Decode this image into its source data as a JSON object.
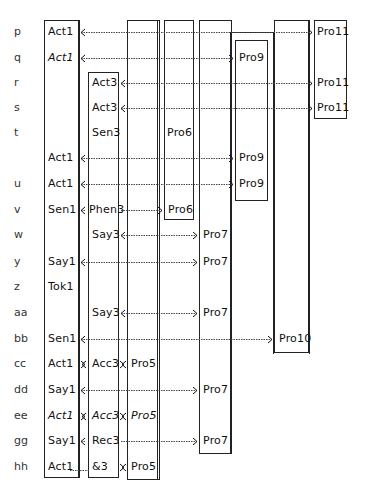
{
  "rows": [
    {
      "label": "p",
      "y": 32
    },
    {
      "label": "q",
      "y": 58
    },
    {
      "label": "r",
      "y": 83
    },
    {
      "label": "s",
      "y": 108
    },
    {
      "label": "t",
      "y": 133
    },
    {
      "label": "",
      "y": 158
    },
    {
      "label": "u",
      "y": 184
    },
    {
      "label": "v",
      "y": 210
    },
    {
      "label": "w",
      "y": 235
    },
    {
      "label": "y",
      "y": 262
    },
    {
      "label": "z",
      "y": 287
    },
    {
      "label": "aa",
      "y": 313
    },
    {
      "label": "bb",
      "y": 339
    },
    {
      "label": "cc",
      "y": 364
    },
    {
      "label": "dd",
      "y": 390
    },
    {
      "label": "ee",
      "y": 416
    },
    {
      "label": "gg",
      "y": 441
    },
    {
      "label": "hh",
      "y": 467
    }
  ],
  "cells": [
    {
      "text": "Act1",
      "x": 48,
      "y": 32,
      "italic": false
    },
    {
      "text": "Act1",
      "x": 48,
      "y": 58,
      "italic": true
    },
    {
      "text": "Act3",
      "x": 92,
      "y": 83,
      "italic": false
    },
    {
      "text": "Act3",
      "x": 92,
      "y": 108,
      "italic": false
    },
    {
      "text": "Sen3",
      "x": 92,
      "y": 133,
      "italic": false
    },
    {
      "text": "Pro6",
      "x": 167,
      "y": 133,
      "italic": false
    },
    {
      "text": "Act1",
      "x": 48,
      "y": 158,
      "italic": false
    },
    {
      "text": "Act1",
      "x": 48,
      "y": 184,
      "italic": false
    },
    {
      "text": "Sen1",
      "x": 48,
      "y": 210,
      "italic": false
    },
    {
      "text": "Phen3",
      "x": 89,
      "y": 210,
      "italic": false
    },
    {
      "text": "Pro6",
      "x": 168,
      "y": 210,
      "italic": false
    },
    {
      "text": "Say3",
      "x": 92,
      "y": 235,
      "italic": false
    },
    {
      "text": "Pro7",
      "x": 203,
      "y": 235,
      "italic": false
    },
    {
      "text": "Say1",
      "x": 48,
      "y": 262,
      "italic": false
    },
    {
      "text": "Pro7",
      "x": 203,
      "y": 262,
      "italic": false
    },
    {
      "text": "Tok1",
      "x": 48,
      "y": 287,
      "italic": false
    },
    {
      "text": "Say3",
      "x": 92,
      "y": 313,
      "italic": false
    },
    {
      "text": "Pro7",
      "x": 203,
      "y": 313,
      "italic": false
    },
    {
      "text": "Sen1",
      "x": 48,
      "y": 339,
      "italic": false
    },
    {
      "text": "Pro10",
      "x": 279,
      "y": 339,
      "italic": false
    },
    {
      "text": "Act1",
      "x": 48,
      "y": 364,
      "italic": false
    },
    {
      "text": "Acc3",
      "x": 92,
      "y": 364,
      "italic": false
    },
    {
      "text": "Pro5",
      "x": 131,
      "y": 364,
      "italic": false
    },
    {
      "text": "Say1",
      "x": 48,
      "y": 390,
      "italic": false
    },
    {
      "text": "Pro7",
      "x": 203,
      "y": 390,
      "italic": false
    },
    {
      "text": "Act1",
      "x": 48,
      "y": 416,
      "italic": true
    },
    {
      "text": "Acc3",
      "x": 92,
      "y": 416,
      "italic": true
    },
    {
      "text": "Pro5",
      "x": 131,
      "y": 416,
      "italic": true
    },
    {
      "text": "Say1",
      "x": 48,
      "y": 441,
      "italic": false
    },
    {
      "text": "Rec3",
      "x": 92,
      "y": 441,
      "italic": false
    },
    {
      "text": "Pro7",
      "x": 203,
      "y": 441,
      "italic": false
    },
    {
      "text": "Act1",
      "x": 48,
      "y": 467,
      "italic": false
    },
    {
      "text": "&3",
      "x": 92,
      "y": 467,
      "italic": false
    },
    {
      "text": "Pro5",
      "x": 131,
      "y": 467,
      "italic": false
    },
    {
      "text": "Pro9",
      "x": 239,
      "y": 58,
      "italic": false
    },
    {
      "text": "Pro9",
      "x": 239,
      "y": 158,
      "italic": false
    },
    {
      "text": "Pro9",
      "x": 239,
      "y": 184,
      "italic": false
    },
    {
      "text": "Pro11",
      "x": 317,
      "y": 32,
      "italic": false
    },
    {
      "text": "Pro11",
      "x": 317,
      "y": 83,
      "italic": false
    },
    {
      "text": "Pro11",
      "x": 317,
      "y": 108,
      "italic": false
    }
  ],
  "boxes": [
    {
      "name": "act1-column",
      "x": 44,
      "y": 20,
      "w": 35,
      "h": 458
    },
    {
      "name": "act3-column",
      "x": 88,
      "y": 72,
      "w": 31,
      "h": 406
    },
    {
      "name": "pro5-column",
      "x": 127,
      "y": 20,
      "w": 33,
      "h": 460
    },
    {
      "name": "pro6-box",
      "x": 164,
      "y": 20,
      "w": 30,
      "h": 200
    },
    {
      "name": "pro7-column",
      "x": 199,
      "y": 20,
      "w": 33,
      "h": 434
    },
    {
      "name": "pro9-box",
      "x": 235,
      "y": 40,
      "w": 33,
      "h": 161
    },
    {
      "name": "pro10-box",
      "x": 274,
      "y": 20,
      "w": 35,
      "h": 333
    },
    {
      "name": "pro11-box",
      "x": 314,
      "y": 20,
      "w": 33,
      "h": 99
    }
  ],
  "extra_vlines": [
    {
      "x": 157,
      "y1": 20,
      "y2": 480
    },
    {
      "x": 79,
      "y1": 20,
      "y2": 478
    },
    {
      "x": 230,
      "y1": 32,
      "y2": 454
    },
    {
      "x": 273,
      "y1": 32,
      "y2": 354
    },
    {
      "x": 309,
      "y1": 20,
      "y2": 354
    }
  ],
  "extra_hlines": [
    {
      "x1": 230,
      "x2": 273,
      "y": 32
    }
  ],
  "arrows": [
    {
      "row": "p",
      "x1": 79,
      "x2": 314,
      "y": 32,
      "head1": "left",
      "head2": "right"
    },
    {
      "row": "q",
      "x1": 79,
      "x2": 235,
      "y": 58,
      "head1": "left",
      "head2": "right"
    },
    {
      "row": "r",
      "x1": 119,
      "x2": 314,
      "y": 83,
      "head1": "left",
      "head2": "right"
    },
    {
      "row": "s",
      "x1": 119,
      "x2": 314,
      "y": 108,
      "head1": "left",
      "head2": "right"
    },
    {
      "row": "act1-pro9-a",
      "x1": 79,
      "x2": 235,
      "y": 158,
      "head1": "left",
      "head2": "right"
    },
    {
      "row": "u",
      "x1": 79,
      "x2": 235,
      "y": 184,
      "head1": "left",
      "head2": "right"
    },
    {
      "row": "v-left",
      "x1": 79,
      "x2": 88,
      "y": 210,
      "head1": "left",
      "head2": "none"
    },
    {
      "row": "v-right",
      "x1": 119,
      "x2": 164,
      "y": 210,
      "head1": "none",
      "head2": "right"
    },
    {
      "row": "w",
      "x1": 119,
      "x2": 199,
      "y": 235,
      "head1": "left",
      "head2": "right"
    },
    {
      "row": "y",
      "x1": 79,
      "x2": 199,
      "y": 262,
      "head1": "left",
      "head2": "right"
    },
    {
      "row": "aa",
      "x1": 119,
      "x2": 199,
      "y": 313,
      "head1": "left",
      "head2": "right"
    },
    {
      "row": "bb",
      "x1": 79,
      "x2": 274,
      "y": 339,
      "head1": "left",
      "head2": "right"
    },
    {
      "row": "cc-a",
      "x1": 80,
      "x2": 87,
      "y": 364,
      "head1": "left",
      "head2": "right"
    },
    {
      "row": "cc-b",
      "x1": 120,
      "x2": 126,
      "y": 364,
      "head1": "left",
      "head2": "right"
    },
    {
      "row": "dd",
      "x1": 79,
      "x2": 199,
      "y": 390,
      "head1": "left",
      "head2": "right"
    },
    {
      "row": "ee-a",
      "x1": 80,
      "x2": 87,
      "y": 416,
      "head1": "left",
      "head2": "right"
    },
    {
      "row": "ee-b",
      "x1": 120,
      "x2": 126,
      "y": 416,
      "head1": "left",
      "head2": "right"
    },
    {
      "row": "gg-left",
      "x1": 79,
      "x2": 88,
      "y": 441,
      "head1": "left",
      "head2": "none"
    },
    {
      "row": "gg-right",
      "x1": 119,
      "x2": 199,
      "y": 441,
      "head1": "none",
      "head2": "right"
    },
    {
      "row": "hh-dots",
      "x1": 68,
      "x2": 92,
      "y": 470,
      "head1": "none",
      "head2": "none",
      "dotted_only": true
    },
    {
      "row": "hh-b",
      "x1": 120,
      "x2": 126,
      "y": 467,
      "head1": "left",
      "head2": "right"
    }
  ]
}
